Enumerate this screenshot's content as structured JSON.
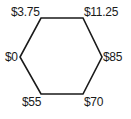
{
  "diagram": {
    "shape": "hexagon",
    "stroke_color": "#1a1a1a",
    "vertices": [
      {
        "id": "top-left",
        "label": "$3.75"
      },
      {
        "id": "top-right",
        "label": "$11.25"
      },
      {
        "id": "right",
        "label": "$85"
      },
      {
        "id": "bottom-right",
        "label": "$70"
      },
      {
        "id": "bottom-left",
        "label": "$55"
      },
      {
        "id": "left",
        "label": "$0"
      }
    ]
  }
}
